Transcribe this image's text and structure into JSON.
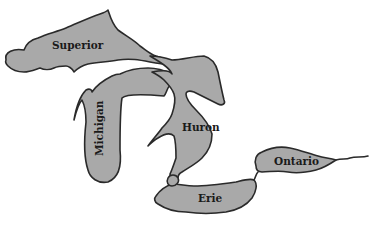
{
  "map": {
    "title": "Great Lakes",
    "lakes": [
      {
        "name": "Superior",
        "label": "Superior"
      },
      {
        "name": "Michigan",
        "label": "Michigan"
      },
      {
        "name": "Huron",
        "label": "Huron"
      },
      {
        "name": "Erie",
        "label": "Erie"
      },
      {
        "name": "Ontario",
        "label": "Ontario"
      }
    ],
    "colors": {
      "water": "#a9a9a9",
      "outline": "#2a2a2a",
      "background": "#ffffff"
    }
  }
}
